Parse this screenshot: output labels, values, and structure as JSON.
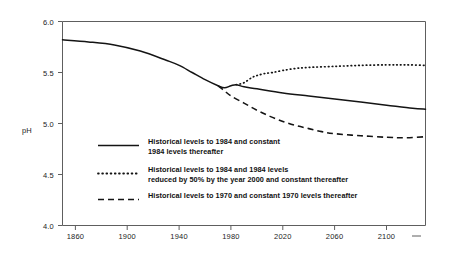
{
  "chart_data": {
    "type": "line",
    "title": "",
    "subtitle": "",
    "xlabel": "",
    "ylabel": "pH",
    "xlim": [
      1850,
      2130
    ],
    "ylim": [
      4.0,
      6.0
    ],
    "grid": false,
    "legend_position": "inside-lower-left",
    "x_ticks": [
      "1860",
      "1900",
      "1940",
      "1980",
      "2020",
      "2060",
      "2100"
    ],
    "x_tick_values": [
      1860,
      1900,
      1940,
      1980,
      2020,
      2060,
      2100
    ],
    "y_ticks": [
      "4.0",
      "4.5",
      "5.0",
      "5.5",
      "6.0"
    ],
    "y_tick_values": [
      4.0,
      4.5,
      5.0,
      5.5,
      6.0
    ],
    "series": [
      {
        "name": "Historical levels to 1984 and constant 1984 levels thereafter",
        "style": "solid",
        "x": [
          1850,
          1870,
          1890,
          1910,
          1930,
          1940,
          1950,
          1960,
          1970,
          1975,
          1980,
          1984,
          1990,
          2000,
          2020,
          2040,
          2060,
          2080,
          2100,
          2120,
          2130
        ],
        "y": [
          5.82,
          5.8,
          5.77,
          5.71,
          5.62,
          5.57,
          5.5,
          5.43,
          5.37,
          5.35,
          5.37,
          5.38,
          5.36,
          5.34,
          5.3,
          5.27,
          5.24,
          5.21,
          5.18,
          5.15,
          5.14
        ]
      },
      {
        "name": "Historical levels to 1984 and 1984 levels reduced by 50% by the year 2000 and constant thereafter",
        "style": "dotted",
        "x": [
          1984,
          1990,
          1996,
          2000,
          2006,
          2012,
          2020,
          2030,
          2040,
          2060,
          2080,
          2100,
          2115,
          2130
        ],
        "y": [
          5.38,
          5.4,
          5.45,
          5.47,
          5.49,
          5.5,
          5.52,
          5.54,
          5.55,
          5.56,
          5.57,
          5.575,
          5.575,
          5.57
        ]
      },
      {
        "name": "Historical levels to 1970 and constant 1970 levels thereafter",
        "style": "dashed",
        "x": [
          1970,
          1975,
          1980,
          1990,
          2000,
          2010,
          2020,
          2030,
          2040,
          2050,
          2060,
          2080,
          2100,
          2115,
          2130
        ],
        "y": [
          5.37,
          5.32,
          5.27,
          5.2,
          5.13,
          5.07,
          5.02,
          4.98,
          4.95,
          4.92,
          4.9,
          4.88,
          4.865,
          4.86,
          4.87
        ]
      }
    ]
  },
  "legend": {
    "entries": [
      {
        "style": "solid",
        "line1": "Historical levels to 1984 and constant",
        "line2": "1984 levels thereafter"
      },
      {
        "style": "dotted",
        "line1": "Historical levels to 1984 and 1984 levels",
        "line2": "reduced by 50% by the year 2000 and constant thereafter"
      },
      {
        "style": "dashed",
        "line1": "Historical levels to 1970 and constant 1970 levels thereafter",
        "line2": ""
      }
    ]
  },
  "colors": {
    "background": "#ffffff",
    "line": "#141414",
    "axis": "#5e5e5e",
    "text": "#1a1a1a"
  }
}
